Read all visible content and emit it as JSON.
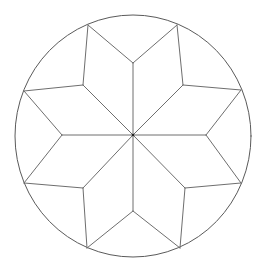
{
  "figure": {
    "stroke_color": "#6e6e6e",
    "circle_color": "#5a5a5a",
    "center_dot_color": "#222222",
    "background": "#ffffff",
    "stroke_width": 1,
    "center": [
      133,
      135
    ],
    "circle": {
      "cx": 133,
      "cy": 136,
      "rx": 118,
      "ry": 121
    },
    "outer_points": [
      [
        88,
        25
      ],
      [
        177,
        25
      ],
      [
        241,
        90
      ],
      [
        241,
        183
      ],
      [
        180,
        248
      ],
      [
        87,
        248
      ],
      [
        24,
        183
      ],
      [
        24,
        91
      ]
    ],
    "axis_vertices": [
      [
        133,
        63
      ],
      [
        206,
        135
      ],
      [
        133,
        211
      ],
      [
        62,
        135
      ]
    ],
    "diagonal_vertices": [
      [
        83,
        85
      ],
      [
        183,
        85
      ],
      [
        185,
        188
      ],
      [
        83,
        188
      ]
    ]
  }
}
